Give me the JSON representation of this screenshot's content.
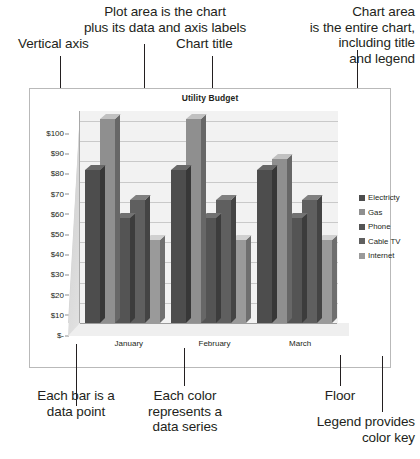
{
  "annotations": [
    {
      "name": "plot-area-callout",
      "text": "Plot area is the chart\nplus its data and axis labels"
    },
    {
      "name": "chart-area-callout",
      "text": "Chart area\nis the entire chart,\nincluding title\nand legend"
    },
    {
      "name": "vertical-axis-callout",
      "text": "Vertical axis"
    },
    {
      "name": "chart-title-callout",
      "text": "Chart title"
    },
    {
      "name": "data-point-callout",
      "text": "Each bar is a\ndata point"
    },
    {
      "name": "data-series-callout",
      "text": "Each color\nrepresents a\ndata series"
    },
    {
      "name": "floor-callout",
      "text": "Floor"
    },
    {
      "name": "legend-callout",
      "text": "Legend provides\ncolor key"
    }
  ],
  "chart_data": {
    "type": "bar",
    "title": "Utility Budget",
    "xlabel": "",
    "ylabel": "",
    "ylim": [
      0,
      100
    ],
    "grid": true,
    "legend_position": "right",
    "categories": [
      "January",
      "February",
      "March"
    ],
    "ytick_labels": [
      "$-",
      "$10",
      "$20",
      "$30",
      "$40",
      "$50",
      "$60",
      "$70",
      "$80",
      "$90",
      "$100"
    ],
    "ytick_values": [
      0,
      10,
      20,
      30,
      40,
      50,
      60,
      70,
      80,
      90,
      100
    ],
    "series": [
      {
        "name": "Electricty",
        "color": "#4d4d4d",
        "values": [
          76,
          76,
          76
        ]
      },
      {
        "name": "Gas",
        "color": "#8f8f8f",
        "values": [
          101,
          101,
          81
        ]
      },
      {
        "name": "Phone",
        "color": "#545454",
        "values": [
          52,
          52,
          52
        ]
      },
      {
        "name": "Cable TV",
        "color": "#5f5f5f",
        "values": [
          61,
          61,
          61
        ]
      },
      {
        "name": "Internet",
        "color": "#9a9a9a",
        "values": [
          41,
          41,
          41
        ]
      }
    ]
  }
}
